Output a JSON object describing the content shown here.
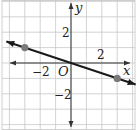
{
  "chart_data": {
    "type": "line",
    "title": "",
    "xlabel": "x",
    "ylabel": "y",
    "origin_label": "O",
    "x_tick_labels": [
      {
        "value": -2,
        "label": "−2"
      },
      {
        "value": 2,
        "label": "2"
      }
    ],
    "y_tick_labels": [
      {
        "value": 2,
        "label": "2"
      },
      {
        "value": -2,
        "label": "−2"
      }
    ],
    "xlim": [
      -4.5,
      4.3
    ],
    "ylim": [
      -4.3,
      4.1
    ],
    "grid": true,
    "grid_step": 1,
    "series": [
      {
        "name": "line",
        "equation": "y = -x/3",
        "points": [
          {
            "x": -3,
            "y": 1
          },
          {
            "x": 3,
            "y": -1
          }
        ],
        "arrows_both_ends": true
      }
    ]
  },
  "colors": {
    "grid": "#c8c8c8",
    "axis": "#333333",
    "line": "#1a1a1a",
    "point": "#7a7a7a",
    "frame": "#d0d0d0"
  }
}
